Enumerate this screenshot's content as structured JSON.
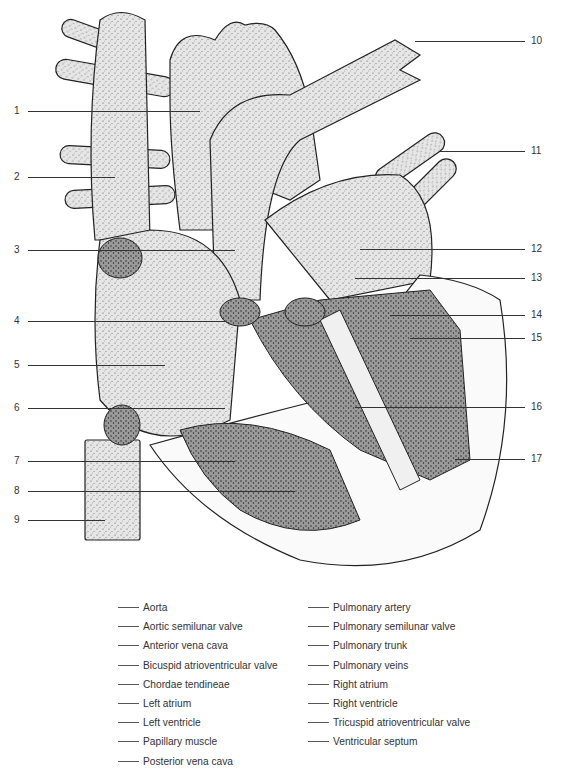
{
  "figure": {
    "type": "labeled anatomical diagram",
    "left_labels": [
      {
        "n": "1",
        "y": 111,
        "line_end_x": 200
      },
      {
        "n": "2",
        "y": 177,
        "line_end_x": 115
      },
      {
        "n": "3",
        "y": 250,
        "line_end_x": 235
      },
      {
        "n": "4",
        "y": 321,
        "line_end_x": 225
      },
      {
        "n": "5",
        "y": 365,
        "line_end_x": 165
      },
      {
        "n": "6",
        "y": 408,
        "line_end_x": 225
      },
      {
        "n": "7",
        "y": 461,
        "line_end_x": 235
      },
      {
        "n": "8",
        "y": 491,
        "line_end_x": 295
      },
      {
        "n": "9",
        "y": 520,
        "line_end_x": 105
      }
    ],
    "right_labels": [
      {
        "n": "10",
        "y": 41,
        "line_start_x": 415
      },
      {
        "n": "11",
        "y": 151,
        "line_start_x": 440
      },
      {
        "n": "12",
        "y": 249,
        "line_start_x": 360
      },
      {
        "n": "13",
        "y": 278,
        "line_start_x": 355
      },
      {
        "n": "14",
        "y": 315,
        "line_start_x": 390
      },
      {
        "n": "15",
        "y": 338,
        "line_start_x": 410
      },
      {
        "n": "16",
        "y": 407,
        "line_start_x": 355
      },
      {
        "n": "17",
        "y": 459,
        "line_start_x": 455
      }
    ]
  },
  "answer_key": {
    "blank": "____",
    "column1": [
      "Aorta",
      "Aortic semilunar valve",
      "Anterior vena cava",
      "Bicuspid atrioventricular valve",
      "Chordae tendineae",
      "Left atrium",
      "Left ventricle",
      "Papillary muscle",
      "Posterior vena cava"
    ],
    "column2": [
      "Pulmonary artery",
      "Pulmonary semilunar valve",
      "Pulmonary trunk",
      "Pulmonary veins",
      "Right atrium",
      "Right ventricle",
      "Tricuspid atrioventricular valve",
      "Ventricular septum"
    ]
  }
}
